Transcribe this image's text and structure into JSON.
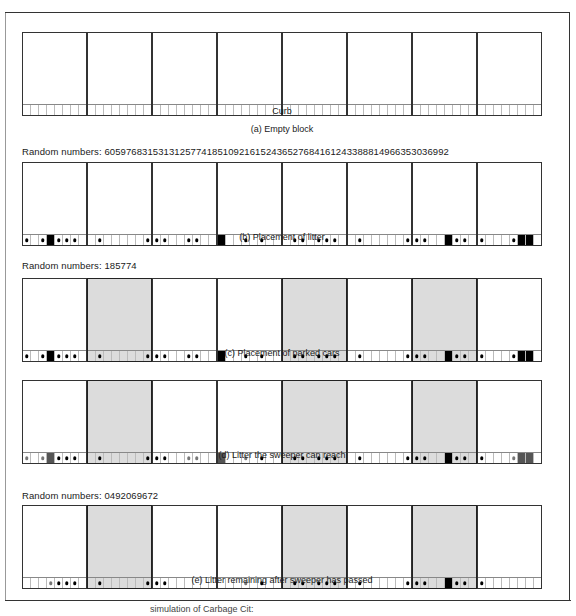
{
  "cells_per_block": 8,
  "curb_label": "Curb",
  "panels": [
    {
      "id": "a",
      "random_numbers_label": "",
      "caption": "(a)  Empty block",
      "parked_blocks": [],
      "blocks": [
        [],
        [],
        [],
        [],
        [],
        [],
        [],
        []
      ]
    },
    {
      "id": "b",
      "random_numbers_label": "Random numbers:  6059768315313125774185109216152436527684161243388814966353036992",
      "caption": "(b)  Placement of litter",
      "parked_blocks": [],
      "blocks": [
        [
          {
            "cell": 1,
            "type": "dot"
          },
          {
            "cell": 3,
            "type": "dot"
          },
          {
            "cell": 4,
            "type": "big"
          },
          {
            "cell": 5,
            "type": "dot"
          },
          {
            "cell": 6,
            "type": "dot"
          },
          {
            "cell": 7,
            "type": "dot"
          }
        ],
        [
          {
            "cell": 2,
            "type": "dot"
          },
          {
            "cell": 8,
            "type": "dot"
          }
        ],
        [
          {
            "cell": 1,
            "type": "dot"
          },
          {
            "cell": 2,
            "type": "dot"
          },
          {
            "cell": 5,
            "type": "dot"
          },
          {
            "cell": 6,
            "type": "dot"
          }
        ],
        [
          {
            "cell": 1,
            "type": "big"
          },
          {
            "cell": 4,
            "type": "dot"
          },
          {
            "cell": 6,
            "type": "dot"
          }
        ],
        [
          {
            "cell": 2,
            "type": "dot"
          },
          {
            "cell": 3,
            "type": "dot"
          },
          {
            "cell": 5,
            "type": "dot"
          },
          {
            "cell": 6,
            "type": "dot"
          },
          {
            "cell": 7,
            "type": "dot"
          }
        ],
        [
          {
            "cell": 2,
            "type": "dot"
          },
          {
            "cell": 8,
            "type": "dot"
          }
        ],
        [
          {
            "cell": 1,
            "type": "dot"
          },
          {
            "cell": 2,
            "type": "dot"
          },
          {
            "cell": 5,
            "type": "big"
          },
          {
            "cell": 6,
            "type": "dot"
          },
          {
            "cell": 7,
            "type": "dot"
          }
        ],
        [
          {
            "cell": 1,
            "type": "dot"
          },
          {
            "cell": 5,
            "type": "dot"
          },
          {
            "cell": 6,
            "type": "big"
          },
          {
            "cell": 7,
            "type": "big"
          }
        ]
      ]
    },
    {
      "id": "c",
      "random_numbers_label": "Random numbers:  185774",
      "caption": "(c)  Placement of parked cars",
      "parked_blocks": [
        2,
        5,
        7
      ],
      "blocks": [
        [
          {
            "cell": 1,
            "type": "dot"
          },
          {
            "cell": 3,
            "type": "dot"
          },
          {
            "cell": 4,
            "type": "big"
          },
          {
            "cell": 5,
            "type": "dot"
          },
          {
            "cell": 6,
            "type": "dot"
          },
          {
            "cell": 7,
            "type": "dot"
          }
        ],
        [
          {
            "cell": 2,
            "type": "dot"
          },
          {
            "cell": 8,
            "type": "dot"
          }
        ],
        [
          {
            "cell": 1,
            "type": "dot"
          },
          {
            "cell": 2,
            "type": "dot"
          },
          {
            "cell": 5,
            "type": "dot"
          },
          {
            "cell": 6,
            "type": "dot"
          }
        ],
        [
          {
            "cell": 1,
            "type": "big"
          },
          {
            "cell": 4,
            "type": "dot"
          },
          {
            "cell": 6,
            "type": "dot"
          }
        ],
        [
          {
            "cell": 2,
            "type": "dot"
          },
          {
            "cell": 3,
            "type": "dot"
          },
          {
            "cell": 5,
            "type": "dot"
          },
          {
            "cell": 6,
            "type": "dot"
          },
          {
            "cell": 7,
            "type": "dot"
          }
        ],
        [
          {
            "cell": 2,
            "type": "dot"
          },
          {
            "cell": 8,
            "type": "dot"
          }
        ],
        [
          {
            "cell": 1,
            "type": "dot"
          },
          {
            "cell": 2,
            "type": "dot"
          },
          {
            "cell": 5,
            "type": "big"
          },
          {
            "cell": 6,
            "type": "dot"
          },
          {
            "cell": 7,
            "type": "dot"
          }
        ],
        [
          {
            "cell": 1,
            "type": "dot"
          },
          {
            "cell": 5,
            "type": "dot"
          },
          {
            "cell": 6,
            "type": "big"
          },
          {
            "cell": 7,
            "type": "big"
          }
        ]
      ]
    },
    {
      "id": "d",
      "random_numbers_label": "",
      "caption": "(d)  Litter the sweeper can reach",
      "parked_blocks": [
        2,
        5,
        7
      ],
      "blocks": [
        [
          {
            "cell": 1,
            "type": "dot",
            "reach": true
          },
          {
            "cell": 3,
            "type": "dot",
            "reach": true
          },
          {
            "cell": 4,
            "type": "big",
            "reach": true
          },
          {
            "cell": 5,
            "type": "dot"
          },
          {
            "cell": 6,
            "type": "dot"
          },
          {
            "cell": 7,
            "type": "dot"
          }
        ],
        [
          {
            "cell": 2,
            "type": "dot"
          },
          {
            "cell": 8,
            "type": "dot"
          }
        ],
        [
          {
            "cell": 1,
            "type": "dot"
          },
          {
            "cell": 2,
            "type": "dot"
          },
          {
            "cell": 5,
            "type": "dot",
            "reach": true
          },
          {
            "cell": 6,
            "type": "dot",
            "reach": true
          }
        ],
        [
          {
            "cell": 1,
            "type": "big",
            "reach": true
          },
          {
            "cell": 4,
            "type": "dot",
            "reach": true
          },
          {
            "cell": 6,
            "type": "dot"
          }
        ],
        [
          {
            "cell": 2,
            "type": "dot"
          },
          {
            "cell": 3,
            "type": "dot"
          },
          {
            "cell": 5,
            "type": "dot"
          },
          {
            "cell": 6,
            "type": "dot"
          },
          {
            "cell": 7,
            "type": "dot"
          }
        ],
        [
          {
            "cell": 2,
            "type": "dot"
          },
          {
            "cell": 8,
            "type": "dot"
          }
        ],
        [
          {
            "cell": 1,
            "type": "dot"
          },
          {
            "cell": 2,
            "type": "dot"
          },
          {
            "cell": 5,
            "type": "big"
          },
          {
            "cell": 6,
            "type": "dot"
          },
          {
            "cell": 7,
            "type": "dot"
          }
        ],
        [
          {
            "cell": 1,
            "type": "dot"
          },
          {
            "cell": 5,
            "type": "dot",
            "reach": true
          },
          {
            "cell": 6,
            "type": "big",
            "reach": true
          },
          {
            "cell": 7,
            "type": "big",
            "reach": true
          }
        ]
      ]
    },
    {
      "id": "e",
      "random_numbers_label": "Random numbers:  0492069672",
      "caption": "(e)  Litter remaining after sweeper has passed",
      "parked_blocks": [
        2,
        5,
        7
      ],
      "blocks": [
        [
          {
            "cell": 4,
            "type": "dot",
            "reach": true
          },
          {
            "cell": 5,
            "type": "dot"
          },
          {
            "cell": 6,
            "type": "dot"
          },
          {
            "cell": 7,
            "type": "dot"
          }
        ],
        [
          {
            "cell": 2,
            "type": "dot"
          },
          {
            "cell": 8,
            "type": "dot"
          }
        ],
        [
          {
            "cell": 1,
            "type": "dot"
          },
          {
            "cell": 2,
            "type": "dot"
          }
        ],
        [
          {
            "cell": 4,
            "type": "dot",
            "reach": true
          },
          {
            "cell": 6,
            "type": "dot"
          }
        ],
        [
          {
            "cell": 2,
            "type": "dot"
          },
          {
            "cell": 3,
            "type": "dot"
          },
          {
            "cell": 5,
            "type": "dot"
          },
          {
            "cell": 6,
            "type": "dot"
          },
          {
            "cell": 7,
            "type": "dot"
          }
        ],
        [
          {
            "cell": 2,
            "type": "dot"
          },
          {
            "cell": 8,
            "type": "dot"
          }
        ],
        [
          {
            "cell": 1,
            "type": "dot"
          },
          {
            "cell": 2,
            "type": "dot"
          },
          {
            "cell": 5,
            "type": "big"
          },
          {
            "cell": 6,
            "type": "dot"
          },
          {
            "cell": 7,
            "type": "dot"
          }
        ],
        [
          {
            "cell": 1,
            "type": "dot"
          }
        ]
      ]
    }
  ],
  "figure_caption_partial": "simulation of Carbage Cit:"
}
